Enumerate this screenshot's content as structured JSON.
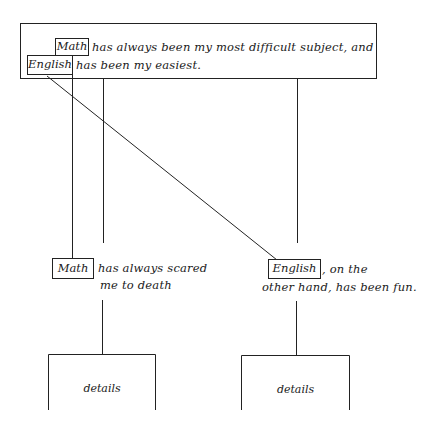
{
  "diagram": {
    "type": "sentence-outline",
    "line_color": "#222222",
    "background": "#ffffff",
    "thesis": {
      "math_keyword": "Math",
      "line1_rest": "has always been my most difficult subject, and",
      "english_keyword": "English",
      "line2_rest": "has been my easiest."
    },
    "branches": [
      {
        "keyword": "Math",
        "line1_rest": "has always scared",
        "line2": "me to death",
        "detail_label": "details"
      },
      {
        "keyword": "English",
        "line1_rest": ", on the",
        "line2": "other hand, has been fun.",
        "detail_label": "details"
      }
    ]
  }
}
